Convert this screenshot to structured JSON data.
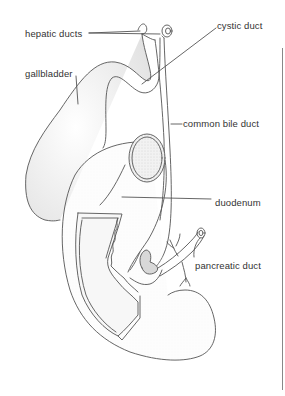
{
  "figure": {
    "labels": [
      {
        "id": "hepatic-ducts",
        "text": "hepatic ducts",
        "x": 25,
        "y": 29
      },
      {
        "id": "cystic-duct",
        "text": "cystic duct",
        "x": 217,
        "y": 21
      },
      {
        "id": "gallbladder",
        "text": "gallbladder",
        "x": 25,
        "y": 69
      },
      {
        "id": "common-bile-duct",
        "text": "common bile duct",
        "x": 183,
        "y": 119
      },
      {
        "id": "duodenum",
        "text": "duodenum",
        "x": 215,
        "y": 198
      },
      {
        "id": "pancreatic-duct",
        "text": "pancreatic duct",
        "x": 195,
        "y": 261
      }
    ],
    "colors": {
      "line": "#555555",
      "shade": "#e8e8e8",
      "text": "#333333",
      "background": "#ffffff"
    }
  }
}
